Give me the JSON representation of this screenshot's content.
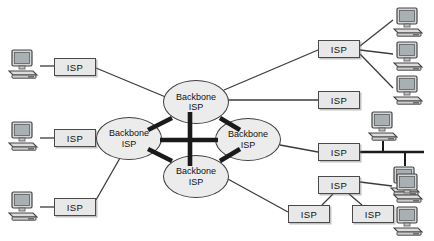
{
  "figure": {
    "background_color": "#ffffff",
    "width": 434,
    "height": 241
  },
  "style": {
    "node_fill": "#e8e8e8",
    "node_stroke": "#4a4a4a",
    "backbone_fill": "#ececec",
    "backbone_stroke": "#3f3f3f",
    "thin_link_color": "#3c3c3c",
    "thick_link_color": "#1a1a1a",
    "text_color": "#111111"
  },
  "labels": {
    "isp": "ISP",
    "backbone_line1": "Backbone",
    "backbone_line2": "ISP"
  },
  "backbones": [
    {
      "id": "bb-top",
      "label_line1": "Backbone",
      "label_line2": "ISP",
      "x": 163,
      "y": 80,
      "w": 66,
      "h": 44
    },
    {
      "id": "bb-left",
      "label_line1": "Backbone",
      "label_line2": "ISP",
      "x": 96,
      "y": 117,
      "w": 66,
      "h": 43
    },
    {
      "id": "bb-right",
      "label_line1": "Backbone",
      "label_line2": "ISP",
      "x": 215,
      "y": 118,
      "w": 66,
      "h": 43
    },
    {
      "id": "bb-bottom",
      "label_line1": "Backbone",
      "label_line2": "ISP",
      "x": 163,
      "y": 155,
      "w": 66,
      "h": 43
    }
  ],
  "isps": [
    {
      "id": "isp-left-top",
      "label": "ISP",
      "x": 54,
      "y": 58,
      "w": 42,
      "h": 18
    },
    {
      "id": "isp-left-mid",
      "label": "ISP",
      "x": 54,
      "y": 129,
      "w": 42,
      "h": 18
    },
    {
      "id": "isp-left-bottom",
      "label": "ISP",
      "x": 54,
      "y": 198,
      "w": 42,
      "h": 18
    },
    {
      "id": "isp-top-right",
      "label": "ISP",
      "x": 318,
      "y": 40,
      "w": 42,
      "h": 18
    },
    {
      "id": "isp-mid-right",
      "label": "ISP",
      "x": 318,
      "y": 91,
      "w": 42,
      "h": 18
    },
    {
      "id": "isp-bus",
      "label": "ISP",
      "x": 318,
      "y": 143,
      "w": 42,
      "h": 18
    },
    {
      "id": "isp-tri-left",
      "label": "ISP",
      "x": 288,
      "y": 205,
      "w": 42,
      "h": 18
    },
    {
      "id": "isp-tri-top",
      "label": "ISP",
      "x": 318,
      "y": 176,
      "w": 42,
      "h": 18
    },
    {
      "id": "isp-tri-right",
      "label": "ISP",
      "x": 352,
      "y": 205,
      "w": 42,
      "h": 18
    }
  ],
  "computers": [
    {
      "id": "pc-left-top",
      "x": 6,
      "y": 48,
      "w": 34,
      "h": 32
    },
    {
      "id": "pc-left-mid",
      "x": 6,
      "y": 120,
      "w": 34,
      "h": 32
    },
    {
      "id": "pc-left-bottom",
      "x": 6,
      "y": 190,
      "w": 34,
      "h": 32
    },
    {
      "id": "pc-topright-1",
      "x": 391,
      "y": 6,
      "w": 34,
      "h": 32
    },
    {
      "id": "pc-topright-2",
      "x": 391,
      "y": 40,
      "w": 34,
      "h": 32
    },
    {
      "id": "pc-topright-3",
      "x": 391,
      "y": 74,
      "w": 34,
      "h": 32
    },
    {
      "id": "pc-bus-top",
      "x": 366,
      "y": 118,
      "w": 34,
      "h": 32
    },
    {
      "id": "pc-bus-bottom",
      "x": 391,
      "y": 155,
      "w": 34,
      "h": 32
    },
    {
      "id": "pc-bottom-1",
      "x": 391,
      "y": 172,
      "w": 34,
      "h": 32
    },
    {
      "id": "pc-bottom-2",
      "x": 391,
      "y": 205,
      "w": 34,
      "h": 32
    }
  ],
  "links": {
    "backbone_mesh": [
      {
        "from": "bb-top",
        "to": "bb-left",
        "weight": "thick"
      },
      {
        "from": "bb-top",
        "to": "bb-right",
        "weight": "thick"
      },
      {
        "from": "bb-left",
        "to": "bb-bottom",
        "weight": "thick"
      },
      {
        "from": "bb-right",
        "to": "bb-bottom",
        "weight": "thick"
      },
      {
        "from": "bb-left",
        "to": "bb-right",
        "weight": "thick"
      },
      {
        "from": "bb-top",
        "to": "bb-bottom",
        "weight": "thick"
      }
    ],
    "access": [
      {
        "from": "pc-left-top",
        "to": "isp-left-top",
        "weight": "thin"
      },
      {
        "from": "pc-left-mid",
        "to": "isp-left-mid",
        "weight": "thin"
      },
      {
        "from": "pc-left-bottom",
        "to": "isp-left-bottom",
        "weight": "thin"
      },
      {
        "from": "isp-left-top",
        "to": "bb-top",
        "weight": "thin"
      },
      {
        "from": "isp-left-mid",
        "to": "bb-left",
        "weight": "thin"
      },
      {
        "from": "isp-left-bottom",
        "to": "bb-left",
        "weight": "thin"
      },
      {
        "from": "bb-top",
        "to": "isp-top-right",
        "weight": "thin"
      },
      {
        "from": "bb-top",
        "to": "isp-mid-right",
        "weight": "thin"
      },
      {
        "from": "bb-right",
        "to": "isp-bus",
        "weight": "thin"
      },
      {
        "from": "bb-bottom",
        "to": "isp-tri-left",
        "weight": "thin"
      },
      {
        "from": "isp-top-right",
        "to": "pc-topright-1",
        "weight": "thin"
      },
      {
        "from": "isp-top-right",
        "to": "pc-topright-2",
        "weight": "thin"
      },
      {
        "from": "isp-top-right",
        "to": "pc-topright-3",
        "weight": "thin"
      },
      {
        "from": "isp-tri-left",
        "to": "isp-tri-top",
        "weight": "thin"
      },
      {
        "from": "isp-tri-top",
        "to": "isp-tri-right",
        "weight": "thin"
      },
      {
        "from": "isp-tri-right",
        "to": "pc-bottom-2",
        "weight": "thin"
      }
    ],
    "bus_segment": {
      "description": "Shared bus LAN attached to isp-bus",
      "y": 152,
      "x_start": 360,
      "x_end": 424,
      "drops": [
        {
          "x": 383,
          "to": "pc-bus-top"
        },
        {
          "x": 405,
          "to": "pc-bus-bottom"
        }
      ]
    }
  }
}
